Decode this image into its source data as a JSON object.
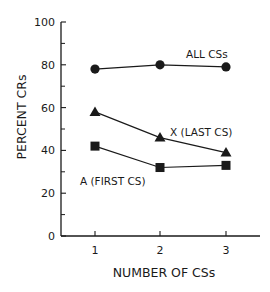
{
  "chart_data": {
    "type": "line",
    "title": "",
    "xlabel": "NUMBER OF CSs",
    "ylabel": "PERCENT CRs",
    "x": [
      1,
      2,
      3
    ],
    "x_tick_labels": [
      "1",
      "2",
      "3"
    ],
    "ylim": [
      0,
      100
    ],
    "y_ticks": [
      0,
      20,
      40,
      60,
      80,
      100
    ],
    "y_tick_labels": [
      "0",
      "20",
      "40",
      "60",
      "80",
      "100"
    ],
    "y_minor_ticks": [
      10,
      30,
      50,
      70,
      90
    ],
    "grid": false,
    "legend": "inline labels",
    "series": [
      {
        "name": "ALL CSs",
        "marker": "circle",
        "values": [
          78,
          80,
          79
        ]
      },
      {
        "name": "X (LAST CS)",
        "marker": "triangle",
        "values": [
          58,
          46,
          39
        ]
      },
      {
        "name": "A (FIRST CS)",
        "marker": "square",
        "values": [
          42,
          32,
          33
        ]
      }
    ],
    "annotations": [
      {
        "text": "ALL CSs",
        "series": 0
      },
      {
        "text": "X (LAST CS)",
        "series": 1
      },
      {
        "text": "A (FIRST CS)",
        "series": 2
      }
    ]
  },
  "colors": {
    "ink": "#1a1a1a",
    "background": "#ffffff"
  }
}
